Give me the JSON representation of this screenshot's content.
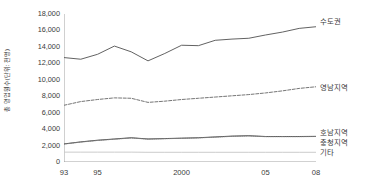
{
  "chart_data": {
    "type": "line",
    "title": "",
    "xlabel": "",
    "ylabel": "총 영업원수(단위: 천명)",
    "x": [
      1993,
      1994,
      1995,
      1996,
      1997,
      1998,
      1999,
      2000,
      2001,
      2002,
      2003,
      2004,
      2005,
      2006,
      2007,
      2008
    ],
    "xtick_labels": [
      "93",
      "95",
      "2000",
      "05",
      "08"
    ],
    "xtick_values": [
      1993,
      1995,
      2000,
      2005,
      2008
    ],
    "ytick_labels": [
      "0",
      "2,000",
      "4,000",
      "6,000",
      "8,000",
      "10,000",
      "12,000",
      "14,000",
      "16,000",
      "18,000"
    ],
    "ytick_values": [
      0,
      2000,
      4000,
      6000,
      8000,
      10000,
      12000,
      14000,
      16000,
      18000
    ],
    "ylim": [
      0,
      18000
    ],
    "xlim": [
      1993,
      2008
    ],
    "grid": false,
    "legend_position": "right",
    "series": [
      {
        "name": "수도권",
        "style": "solid",
        "color": "#5a5a5a",
        "values": [
          12700,
          12500,
          13100,
          14100,
          13400,
          12300,
          13200,
          14200,
          14150,
          14800,
          14950,
          15050,
          15450,
          15800,
          16250,
          16450
        ]
      },
      {
        "name": "영남지역",
        "style": "dashed",
        "color": "#6e6e6e",
        "values": [
          6900,
          7350,
          7600,
          7800,
          7750,
          7250,
          7400,
          7600,
          7750,
          7900,
          8050,
          8200,
          8400,
          8650,
          8950,
          9150
        ]
      },
      {
        "name": "호남지역",
        "style": "solid",
        "color": "#4a4a4a",
        "values": [
          2200,
          2450,
          2650,
          2800,
          2950,
          2800,
          2850,
          2900,
          2950,
          3050,
          3150,
          3200,
          3100,
          3100,
          3100,
          3120
        ]
      },
      {
        "name": "충청지역",
        "style": "dotted",
        "color": "#7a7a7a",
        "values": [
          2180,
          2420,
          2620,
          2770,
          2920,
          2780,
          2830,
          2880,
          2930,
          3020,
          3120,
          3170,
          3080,
          3080,
          3080,
          3100
        ]
      },
      {
        "name": "기타",
        "style": "solid",
        "color": "#c8c8c8",
        "values": [
          1200,
          1200,
          1200,
          1200,
          1200,
          1180,
          1180,
          1180,
          1180,
          1180,
          1180,
          1180,
          1180,
          1180,
          1180,
          1180
        ]
      }
    ]
  },
  "axis": {
    "y_title": "총 영업원수(단위: 천명)"
  }
}
